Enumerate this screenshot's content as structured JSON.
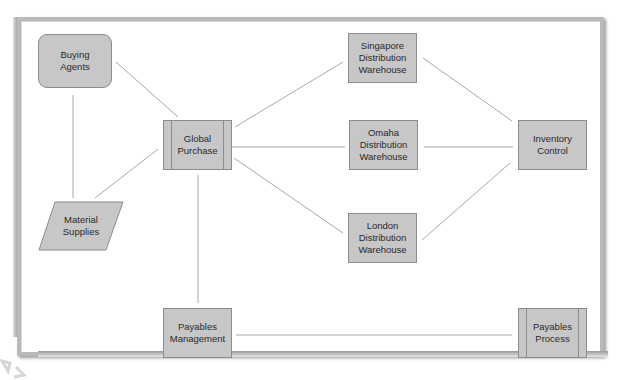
{
  "diagram": {
    "type": "flowchart",
    "colors": {
      "node_fill": "#c7c7c7",
      "node_border": "#8c8c8c",
      "edge": "#a8a8a8",
      "frame": "#b9b9b9"
    },
    "nodes": [
      {
        "id": "buying_agents",
        "label": "Buying\nAgents",
        "shape": "rounded-rectangle"
      },
      {
        "id": "global_purchase",
        "label": "Global\nPurchase",
        "shape": "predefined-process"
      },
      {
        "id": "material_supplies",
        "label": "Material\nSupplies",
        "shape": "parallelogram"
      },
      {
        "id": "singapore",
        "label": "Singapore\nDistribution\nWarehouse",
        "shape": "rectangle"
      },
      {
        "id": "omaha",
        "label": "Omaha\nDistribution\nWarehouse",
        "shape": "rectangle"
      },
      {
        "id": "london",
        "label": "London\nDistribution\nWarehouse",
        "shape": "rectangle"
      },
      {
        "id": "inventory_control",
        "label": "Inventory\nControl",
        "shape": "rectangle"
      },
      {
        "id": "payables_management",
        "label": "Payables\nManagement",
        "shape": "rectangle"
      },
      {
        "id": "payables_process",
        "label": "Payables\nProcess",
        "shape": "predefined-process"
      }
    ],
    "edges": [
      [
        "buying_agents",
        "global_purchase"
      ],
      [
        "buying_agents",
        "material_supplies"
      ],
      [
        "material_supplies",
        "global_purchase"
      ],
      [
        "global_purchase",
        "singapore"
      ],
      [
        "global_purchase",
        "omaha"
      ],
      [
        "global_purchase",
        "london"
      ],
      [
        "singapore",
        "inventory_control"
      ],
      [
        "omaha",
        "inventory_control"
      ],
      [
        "london",
        "inventory_control"
      ],
      [
        "global_purchase",
        "payables_management"
      ],
      [
        "payables_management",
        "payables_process"
      ]
    ]
  }
}
